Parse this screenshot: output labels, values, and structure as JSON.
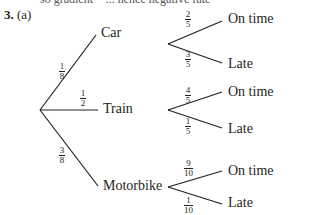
{
  "clipped_text": "so gradient = ... hence negative rate",
  "question": {
    "number": "3.",
    "part": "(a)"
  },
  "tree": {
    "first_level": [
      {
        "label": "Car",
        "prob": {
          "num": "1",
          "den": "8"
        }
      },
      {
        "label": "Train",
        "prob": {
          "num": "1",
          "den": "2"
        }
      },
      {
        "label": "Motorbike",
        "prob": {
          "num": "3",
          "den": "8"
        }
      }
    ],
    "second_level": [
      {
        "parent": "Car",
        "branches": [
          {
            "label": "On time",
            "prob": {
              "num": "2",
              "den": "5"
            }
          },
          {
            "label": "Late",
            "prob": {
              "num": "3",
              "den": "5"
            }
          }
        ]
      },
      {
        "parent": "Train",
        "branches": [
          {
            "label": "On time",
            "prob": {
              "num": "4",
              "den": "5"
            }
          },
          {
            "label": "Late",
            "prob": {
              "num": "1",
              "den": "5"
            }
          }
        ]
      },
      {
        "parent": "Motorbike",
        "branches": [
          {
            "label": "On time",
            "prob": {
              "num": "9",
              "den": "10"
            }
          },
          {
            "label": "Late",
            "prob": {
              "num": "1",
              "den": "10"
            }
          }
        ]
      }
    ]
  }
}
